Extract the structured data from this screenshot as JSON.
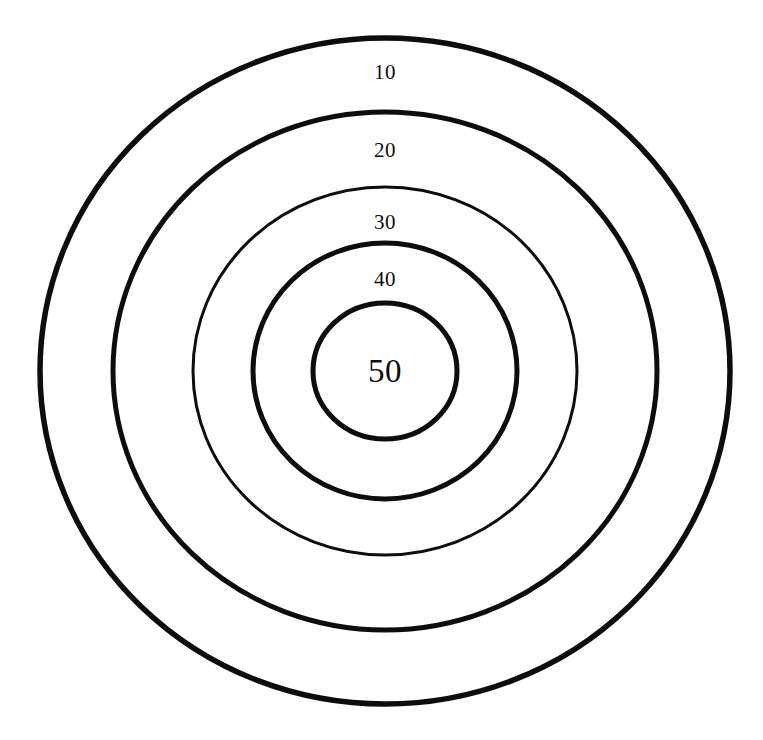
{
  "figure": {
    "name": "concentric-circle-target",
    "background_color": "#ffffff",
    "stroke_color": "#0d0d0d",
    "width": 763,
    "height": 740,
    "center_x": 385,
    "center_y": 371
  },
  "chart_data": {
    "type": "pie",
    "title": "",
    "subtitle": "",
    "xlabel": "",
    "ylabel": "",
    "legend_position": "none",
    "grid": false,
    "categories": [
      "10",
      "20",
      "30",
      "40",
      "50"
    ],
    "values": [
      10,
      20,
      30,
      40,
      50
    ],
    "series": [
      {
        "name": "ring_score",
        "values": [
          10,
          20,
          30,
          40,
          50
        ]
      }
    ],
    "rings": [
      {
        "index": 1,
        "label": "10",
        "value": 10,
        "position": "outermost",
        "cx": 385,
        "cy": 371,
        "rx": 345,
        "ry": 333,
        "stroke_width": 5.5,
        "label_x": 385,
        "label_y": 72
      },
      {
        "index": 2,
        "label": "20",
        "value": 20,
        "position": "second",
        "cx": 385,
        "cy": 371,
        "rx": 272,
        "ry": 259,
        "stroke_width": 5.0,
        "label_x": 385,
        "label_y": 150
      },
      {
        "index": 3,
        "label": "30",
        "value": 30,
        "position": "middle",
        "cx": 385,
        "cy": 371,
        "rx": 192,
        "ry": 184,
        "stroke_width": 3.0,
        "label_x": 385,
        "label_y": 222
      },
      {
        "index": 4,
        "label": "40",
        "value": 40,
        "position": "fourth",
        "cx": 385,
        "cy": 371,
        "rx": 132,
        "ry": 128,
        "stroke_width": 5.0,
        "label_x": 385,
        "label_y": 279
      },
      {
        "index": 5,
        "label": "50",
        "value": 50,
        "position": "bullseye",
        "cx": 385,
        "cy": 371,
        "rx": 72,
        "ry": 68,
        "stroke_width": 5.0,
        "label_x": 385,
        "label_y": 371
      }
    ]
  },
  "labels": {
    "ring_10": "10",
    "ring_20": "20",
    "ring_30": "30",
    "ring_40": "40",
    "bullseye_50": "50"
  }
}
